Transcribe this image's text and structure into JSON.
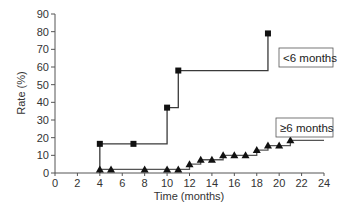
{
  "chart_data": {
    "type": "line",
    "subtype": "step",
    "title": "",
    "xlabel": "Time (months)",
    "ylabel": "Rate (%)",
    "xlim": [
      0,
      24
    ],
    "ylim": [
      0,
      90
    ],
    "xticks": [
      0,
      2,
      4,
      6,
      8,
      10,
      12,
      14,
      16,
      18,
      20,
      22,
      24
    ],
    "yticks": [
      0,
      10,
      20,
      30,
      40,
      50,
      60,
      70,
      80,
      90
    ],
    "grid": false,
    "legend_position": "inline labels at right",
    "series": [
      {
        "name": "<6 months",
        "marker": "square",
        "color": "#3a3a3a",
        "x": [
          4,
          7,
          10,
          11,
          19
        ],
        "y": [
          16.5,
          16.5,
          37,
          58,
          79
        ],
        "step_end_x": 19
      },
      {
        "name": "≥6 months",
        "marker": "triangle",
        "color": "#555555",
        "x": [
          4,
          5,
          8,
          10,
          11,
          12,
          13,
          14,
          15,
          16,
          17,
          18,
          19,
          20,
          21
        ],
        "y": [
          2,
          2,
          2,
          2,
          2,
          5,
          7.5,
          7.5,
          10,
          10,
          10,
          13,
          15.5,
          15.5,
          18.5
        ],
        "step_end_x": 24
      }
    ]
  },
  "labels": {
    "xlabel": "Time (months)",
    "ylabel": "Rate (%)",
    "legend_lt6": "<6 months",
    "legend_ge6": "≥6 months"
  }
}
